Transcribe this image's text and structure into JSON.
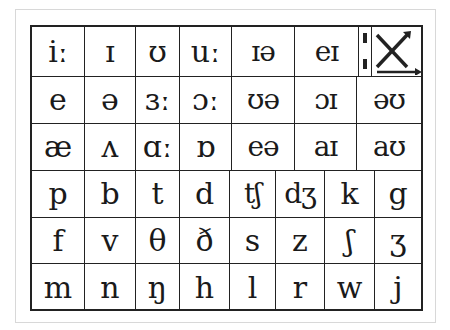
{
  "rows": [
    {
      "cells": [
        "iː",
        "ɪ",
        "ʊ",
        "uː",
        "ɪə",
        "eɪ"
      ],
      "special_last": {
        "length_mark": "ː",
        "symbol": "✕",
        "icon": "x-arrows-icon"
      }
    },
    {
      "cells": [
        "e",
        "ə",
        "ɜː",
        "ɔː",
        "ʊə",
        "ɔɪ",
        "əʊ"
      ]
    },
    {
      "cells": [
        "æ",
        "ʌ",
        "ɑː",
        "ɒ",
        "eə",
        "aɪ",
        "aʊ"
      ]
    },
    {
      "cells": [
        "p",
        "b",
        "t",
        "d",
        "tʃ",
        "dʒ",
        "k",
        "g"
      ]
    },
    {
      "cells": [
        "f",
        "v",
        "θ",
        "ð",
        "s",
        "z",
        "ʃ",
        "ʒ"
      ]
    },
    {
      "cells": [
        "m",
        "n",
        "ŋ",
        "h",
        "l",
        "r",
        "w",
        "j"
      ]
    }
  ]
}
